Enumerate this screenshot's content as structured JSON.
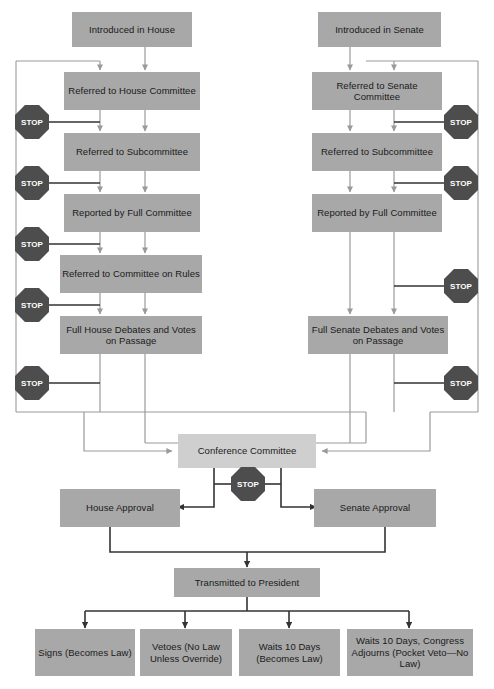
{
  "diagram": {
    "colors": {
      "node_fill": "#a8a8a8",
      "node_fill_light": "#cfcfcf",
      "stop_fill": "#4d4d4d",
      "stop_text": "#ffffff",
      "connector_dark": "#333333",
      "connector_light": "#999999",
      "background": "#ffffff"
    },
    "stop_label": "STOP",
    "house_column": {
      "intro": "Introduced in House",
      "committee": "Referred to House Committee",
      "subcommittee": "Referred to Subcommittee",
      "reported": "Reported by Full Committee",
      "rules": "Referred to Committee on Rules",
      "debate": "Full House Debates and Votes on Passage"
    },
    "senate_column": {
      "intro": "Introduced in Senate",
      "committee": "Referred to Senate Committee",
      "subcommittee": "Referred to Subcommittee",
      "reported": "Reported by Full Committee",
      "debate": "Full Senate Debates and Votes on Passage"
    },
    "conference": {
      "committee": "Conference Committee",
      "house_approval": "House Approval",
      "senate_approval": "Senate Approval"
    },
    "president": {
      "transmitted": "Transmitted to President",
      "outcomes": [
        "Signs (Becomes Law)",
        "Vetoes (No Law Unless Override)",
        "Waits 10 Days (Becomes Law)",
        "Waits 10 Days, Congress Adjourns (Pocket Veto—No Law)"
      ]
    },
    "stops": {
      "house": [
        "STOP",
        "STOP",
        "STOP",
        "STOP",
        "STOP"
      ],
      "senate": [
        "STOP",
        "STOP",
        "STOP",
        "STOP"
      ],
      "conference": "STOP"
    }
  }
}
